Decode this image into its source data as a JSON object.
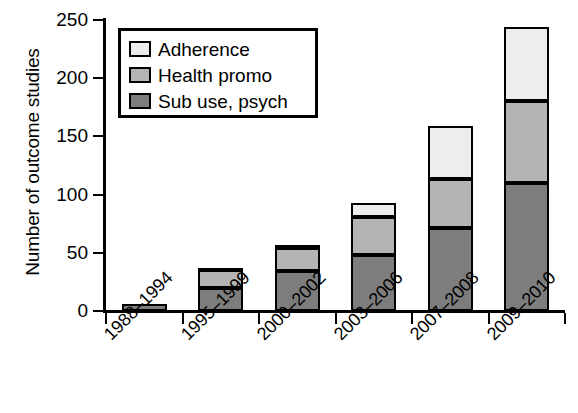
{
  "chart_data": {
    "type": "bar",
    "subtype": "stacked-bar",
    "title": "",
    "xlabel": "",
    "ylabel": "Number of outcome studies",
    "categories": [
      "1988–1994",
      "1995–1999",
      "2000–2002",
      "2003–2006",
      "2007–2008",
      "2009–2010"
    ],
    "series": [
      {
        "name": "Sub use, psych",
        "values": [
          6,
          20,
          34,
          48,
          71,
          110
        ],
        "color": "#7d7d7d"
      },
      {
        "name": "Health promo",
        "values": [
          0,
          15,
          20,
          33,
          42,
          70
        ],
        "color": "#b4b4b4"
      },
      {
        "name": "Adherence",
        "values": [
          0,
          2,
          3,
          12,
          46,
          64
        ],
        "color": "#ededed"
      }
    ],
    "totals": [
      6,
      37,
      57,
      93,
      159,
      244
    ],
    "ylim": [
      0,
      250
    ],
    "yticks": [
      0,
      50,
      100,
      150,
      200,
      250
    ],
    "ytick_labels": [
      "0",
      "50",
      "100",
      "150",
      "200",
      "250"
    ],
    "grid": false,
    "legend_position": "upper left",
    "legend_entries": [
      "Adherence",
      "Health promo",
      "Sub use, psych"
    ],
    "stack_order_bottom_to_top": [
      "Sub use, psych",
      "Health promo",
      "Adherence"
    ]
  }
}
